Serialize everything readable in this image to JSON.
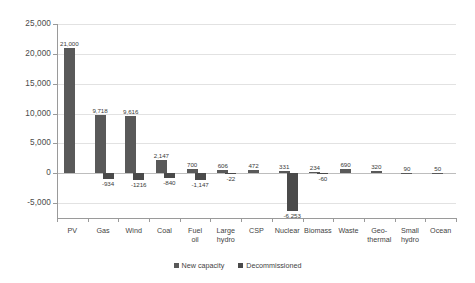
{
  "chart_data": {
    "type": "bar",
    "title": "",
    "subtitle": "",
    "xlabel": "",
    "ylabel": "",
    "ylim": [
      -7500,
      25000
    ],
    "yticks": [
      25000,
      20000,
      15000,
      10000,
      5000,
      0,
      -5000
    ],
    "ytick_labels": [
      "25,000",
      "20,000",
      "15,000",
      "10,000",
      "5,000",
      "0",
      "-5,000"
    ],
    "grid": true,
    "legend_position": "bottom-center",
    "categories": [
      "PV",
      "Gas",
      "Wind",
      "Coal",
      "Fuel\noil",
      "Large\nhydro",
      "CSP",
      "Nuclear",
      "Biomass",
      "Waste",
      "Geo-\nthermal",
      "Small\nhydro",
      "Ocean"
    ],
    "series": [
      {
        "name": "New capacity",
        "color": "#595959",
        "values": [
          21000,
          9718,
          9616,
          2147,
          700,
          606,
          472,
          331,
          234,
          690,
          320,
          90,
          50
        ],
        "labels": [
          "21,000",
          "9,718",
          "9,616",
          "2,147",
          "700",
          "606",
          "472",
          "331",
          "234",
          "690",
          "320",
          "90",
          "50"
        ]
      },
      {
        "name": "Decommissioned",
        "color": "#4a4a4a",
        "values": [
          0,
          -934,
          -1216,
          -840,
          -1147,
          -22,
          0,
          -6253,
          -60,
          0,
          0,
          0,
          0
        ],
        "labels": [
          "",
          "-934",
          "-1216",
          "-840",
          "-1,147",
          "-22",
          "",
          "-6,253",
          "-60",
          "",
          "",
          "",
          ""
        ]
      }
    ]
  },
  "legend": {
    "items": [
      {
        "label": "New capacity"
      },
      {
        "label": "Decommissioned"
      }
    ]
  }
}
